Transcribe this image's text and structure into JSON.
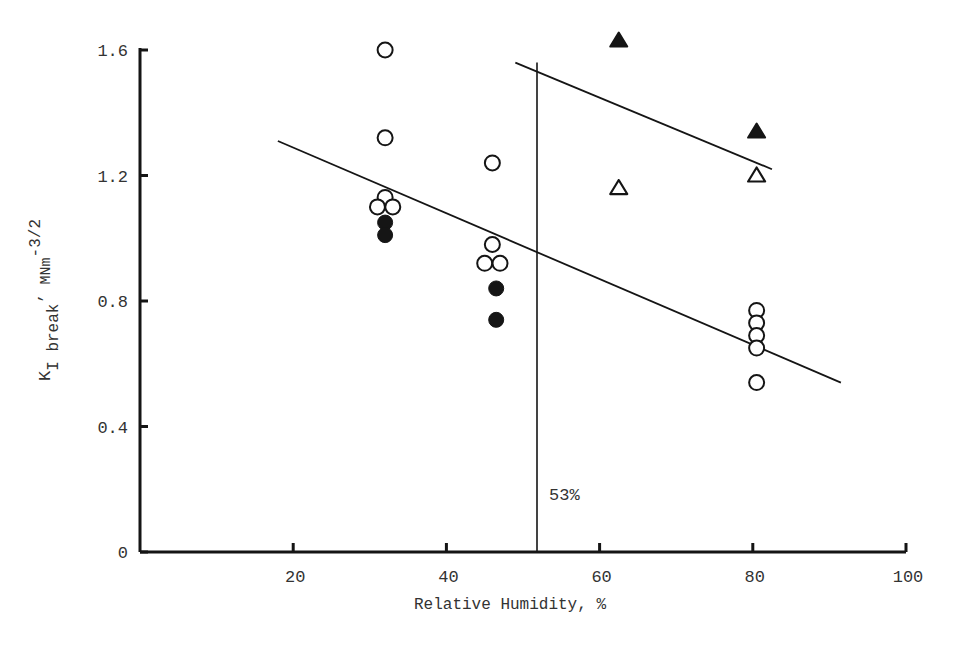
{
  "chart_data": {
    "type": "scatter",
    "title": "",
    "xlabel": "Relative Humidity, %",
    "ylabel": {
      "base": "K",
      "sub": "I break",
      "unit": "MNm",
      "sup": "-3/2"
    },
    "xlim": [
      0,
      100
    ],
    "ylim": [
      0,
      1.6
    ],
    "x_ticks": [
      20,
      40,
      60,
      80,
      100
    ],
    "x_tick_labels": [
      "20",
      "40",
      "60",
      "80",
      "100"
    ],
    "y_ticks": [
      0,
      0.4,
      0.8,
      1.2,
      1.6
    ],
    "y_tick_labels": [
      "0",
      "0.4",
      "0.8",
      "1.2",
      "1.6"
    ],
    "grid": false,
    "legend": null,
    "series": [
      {
        "name": "open circles",
        "marker": "circle-open",
        "points": [
          [
            32,
            1.6
          ],
          [
            32,
            1.32
          ],
          [
            32,
            1.13
          ],
          [
            31,
            1.1
          ],
          [
            33,
            1.1
          ],
          [
            46,
            1.24
          ],
          [
            46,
            0.98
          ],
          [
            45,
            0.92
          ],
          [
            47,
            0.92
          ],
          [
            80.5,
            0.77
          ],
          [
            80.5,
            0.73
          ],
          [
            80.5,
            0.69
          ],
          [
            80.5,
            0.65
          ],
          [
            80.5,
            0.54
          ]
        ]
      },
      {
        "name": "filled circles",
        "marker": "circle-filled",
        "points": [
          [
            32,
            1.05
          ],
          [
            32,
            1.01
          ],
          [
            46.5,
            0.84
          ],
          [
            46.5,
            0.74
          ]
        ]
      },
      {
        "name": "filled triangles",
        "marker": "triangle-filled",
        "points": [
          [
            62.5,
            1.63
          ],
          [
            80.5,
            1.34
          ]
        ]
      },
      {
        "name": "open triangles",
        "marker": "triangle-open",
        "points": [
          [
            62.5,
            1.16
          ],
          [
            80.5,
            1.2
          ]
        ]
      }
    ],
    "lines": [
      {
        "name": "lower trend line",
        "from": [
          18,
          1.31
        ],
        "to": [
          91.5,
          0.54
        ]
      },
      {
        "name": "upper trend line",
        "from": [
          49,
          1.56
        ],
        "to": [
          82.5,
          1.22
        ]
      }
    ],
    "annotations": [
      {
        "type": "vline",
        "x": 52,
        "y_top": 1.56,
        "label": "53%"
      }
    ]
  }
}
